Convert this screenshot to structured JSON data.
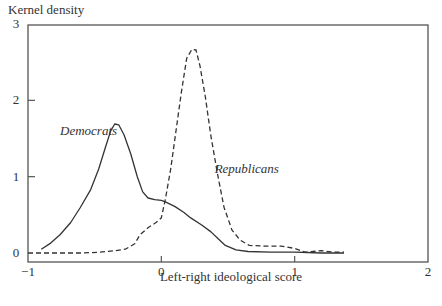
{
  "chart_data": {
    "type": "line",
    "title": "",
    "xlabel": "Left-right ideological score",
    "ylabel": "Kernel density",
    "xlim": [
      -1,
      2
    ],
    "ylim": [
      0,
      3
    ],
    "x_ticks": [
      -1,
      0,
      1,
      2
    ],
    "x_tick_labels": [
      "−1",
      "0",
      "1",
      "2"
    ],
    "y_ticks": [
      0,
      1,
      2,
      3
    ],
    "y_tick_labels": [
      "0",
      "1",
      "2",
      "3"
    ],
    "grid": false,
    "legend": "inline labels",
    "series": [
      {
        "name": "Democrats",
        "style": "solid",
        "label_pos": [
          -0.76,
          1.55
        ],
        "x": [
          -0.9,
          -0.83,
          -0.76,
          -0.68,
          -0.61,
          -0.53,
          -0.47,
          -0.42,
          -0.38,
          -0.35,
          -0.32,
          -0.28,
          -0.23,
          -0.18,
          -0.14,
          -0.1,
          -0.05,
          0.0,
          0.03,
          0.1,
          0.17,
          0.22,
          0.3,
          0.37,
          0.43,
          0.48,
          0.56,
          0.65,
          0.82,
          1.0,
          1.2,
          1.37
        ],
        "y": [
          0.05,
          0.13,
          0.24,
          0.4,
          0.59,
          0.83,
          1.1,
          1.38,
          1.6,
          1.69,
          1.68,
          1.55,
          1.3,
          1.0,
          0.8,
          0.72,
          0.7,
          0.69,
          0.67,
          0.61,
          0.53,
          0.46,
          0.37,
          0.28,
          0.18,
          0.1,
          0.04,
          0.02,
          0.01,
          0.01,
          0.0,
          0.0
        ]
      },
      {
        "name": "Republicans",
        "style": "dashed",
        "label_pos": [
          0.4,
          1.05
        ],
        "x": [
          -1.0,
          -0.8,
          -0.6,
          -0.46,
          -0.35,
          -0.27,
          -0.2,
          -0.16,
          -0.1,
          -0.04,
          0.0,
          0.03,
          0.07,
          0.11,
          0.15,
          0.19,
          0.23,
          0.26,
          0.29,
          0.33,
          0.37,
          0.42,
          0.47,
          0.53,
          0.59,
          0.66,
          0.78,
          0.9,
          1.0,
          1.08,
          1.2,
          1.3,
          1.37
        ],
        "y": [
          0.0,
          0.0,
          0.0,
          0.01,
          0.03,
          0.05,
          0.12,
          0.24,
          0.33,
          0.4,
          0.46,
          0.7,
          1.1,
          1.6,
          2.1,
          2.55,
          2.67,
          2.66,
          2.45,
          2.05,
          1.55,
          1.05,
          0.6,
          0.3,
          0.17,
          0.1,
          0.09,
          0.09,
          0.06,
          0.01,
          0.03,
          0.01,
          0.01
        ]
      }
    ]
  }
}
